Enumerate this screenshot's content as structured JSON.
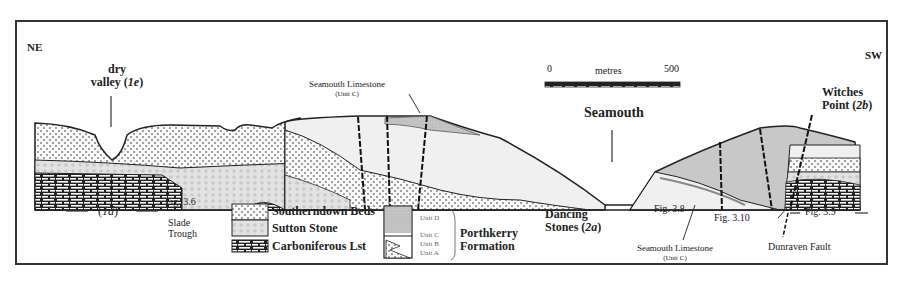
{
  "orientation": {
    "left": "NE",
    "right": "SW"
  },
  "scale_bar": {
    "start": "0",
    "unit": "metres",
    "end": "500"
  },
  "place_labels": {
    "dry_valley_line1": "dry",
    "dry_valley_line2": "valley (",
    "dry_valley_ref": "1e",
    "seamouth": "Seamouth",
    "witches_line1": "Witches",
    "witches_line2": "Point (",
    "witches_ref": "2b",
    "dancing_line1": "Dancing",
    "dancing_line2": "Stones (",
    "dancing_ref": "2a",
    "slade_line1": "Slade",
    "slade_line2": "Trough",
    "id_ref": "1d",
    "dunraven": "Dunraven Fault"
  },
  "annotations": {
    "seamouth_limestone_top": "Seamouth Limestone",
    "unit_c_top": "(Unit C)",
    "seamouth_limestone_bottom": "Seamouth Limestone",
    "unit_c_bottom": "(Unit C)"
  },
  "figure_refs": {
    "fig36": "Fig. 3.6",
    "fig38": "Fig. 3.8",
    "fig310": "Fig. 3.10",
    "fig39": "Fig. 3.9"
  },
  "legend": {
    "items": [
      {
        "label": "Southerndown Beds",
        "pattern": "dotted"
      },
      {
        "label": "Sutton Stone",
        "pattern": "stippled-circles"
      },
      {
        "label": "Carboniferous Lst",
        "pattern": "brick"
      }
    ],
    "porthkerry": {
      "units": [
        "Unit D",
        "Unit C",
        "Unit B",
        "Unit A"
      ],
      "formation_line1": "Porthkerry",
      "formation_line2": "Formation"
    }
  },
  "colors": {
    "line": "#222222",
    "unit_d_fill": "#c8c8c8",
    "light_fill": "#f0f0f0",
    "sutton_fill": "#e2e2e2"
  }
}
